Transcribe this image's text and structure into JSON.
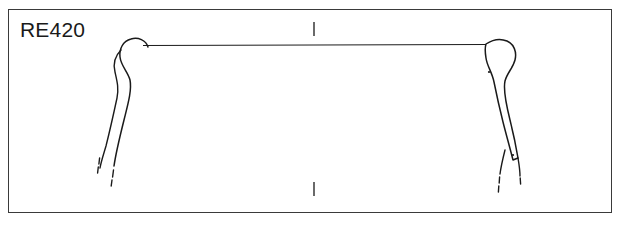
{
  "figure": {
    "kind": "archaeological-vessel-profile-drawing",
    "specimen_label": "RE420",
    "background_color": "#ffffff",
    "ink_color": "#1a1a1a",
    "frame": {
      "border_color": "#3a3a3a",
      "x": 8,
      "y": 9,
      "width": 604,
      "height": 204
    }
  },
  "drawing": {
    "rim_line": {
      "name": "rim-diameter-line",
      "x1": 143,
      "y1": 45.5,
      "x2": 486,
      "y2": 44.5,
      "stroke_width": 1.1
    },
    "axis_ticks": [
      {
        "name": "top-center-tick",
        "x": 314,
        "y1": 22,
        "y2": 36
      },
      {
        "name": "bottom-center-tick",
        "x": 314,
        "y1": 182,
        "y2": 196
      }
    ],
    "left_profile": {
      "name": "left-rim-section",
      "outer_edge": "M 148,47 C 146,40 138,37 131,39 C 123,41 119,49 120,57 C 121,66 128,72 130,80 C 132,90 128,104 124,120 C 120,136 116,152 114,166",
      "inner_edge": "M 121,50 C 115,56 113,64 115,72 C 117,81 119,88 117,98 C 114,112 110,130 106,146 C 103,156 101,162 100,168",
      "outer_break_dashes": [
        {
          "x1": 113.5,
          "y1": 170,
          "x2": 112.6,
          "y2": 177
        },
        {
          "x1": 112.0,
          "y1": 180,
          "x2": 111.2,
          "y2": 186
        }
      ],
      "inner_break_dashes": [
        {
          "x1": 99.6,
          "y1": 158,
          "x2": 98.9,
          "y2": 164
        },
        {
          "x1": 98.3,
          "y1": 167,
          "x2": 97.6,
          "y2": 173
        }
      ]
    },
    "right_profile": {
      "name": "right-rim-section",
      "outline": "M 486,44 C 492,40 500,38 507,41 C 514,44 517,52 515,60 C 513,68 507,73 505,81 C 503,90 506,104 510,120 C 513,132 516,146 518,158 L 513,160 C 510,148 506,134 503,122 C 499,106 496,92 494,82 C 492,72 487,66 486,58 C 485,52 485,47 486,44 Z",
      "outer_tail": "M 518,158 C 519,164 520,170 520,176",
      "inner_tail": "M 505,150 C 503,158 501,166 500,174",
      "outer_break_dashes": [
        {
          "x1": 520.2,
          "y1": 178,
          "x2": 520.6,
          "y2": 184
        }
      ],
      "inner_break_dashes": [
        {
          "x1": 499.6,
          "y1": 177,
          "x2": 499.2,
          "y2": 183
        },
        {
          "x1": 498.8,
          "y1": 186,
          "x2": 498.4,
          "y2": 192
        }
      ],
      "inclusion_dots": [
        {
          "name": "inclusion-dot-upper",
          "cx": 489,
          "cy": 72,
          "r": 1.1
        },
        {
          "name": "inclusion-dot-lower",
          "cx": 513,
          "cy": 155,
          "r": 1.1
        }
      ]
    }
  }
}
